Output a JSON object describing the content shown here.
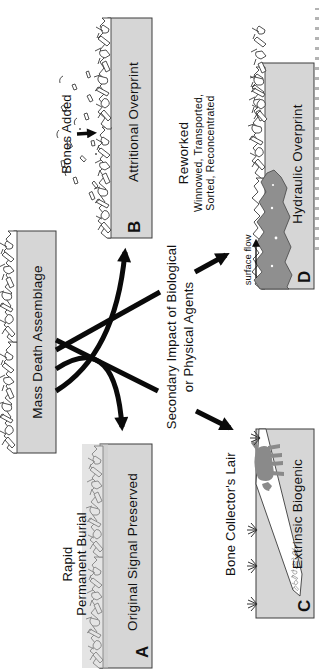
{
  "diagram": {
    "source_label": "Mass Death Assemblage",
    "center_label_line1": "Secondary Impact of Biological",
    "center_label_line2": "or Physical Agents",
    "panels": {
      "a": {
        "letter": "A",
        "title": "Original Signal Preserved",
        "caption_line1": "Rapid",
        "caption_line2": "Permanent Burial"
      },
      "b": {
        "letter": "B",
        "title": "Attritional Overprint",
        "caption": "Bones Added"
      },
      "c": {
        "letter": "C",
        "title": "Extrinsic Biogenic",
        "caption": "Bone Collector's Lair"
      },
      "d": {
        "letter": "D",
        "title": "Hydraulic Overprint",
        "caption_line1": "Reworked",
        "caption_line2": "Winnowed, Transported,",
        "caption_line3": "Sorted, Reconcentrated",
        "flow_label": "surface flow"
      }
    },
    "colors": {
      "strip": "#d6d6d6",
      "water": "#8f8f8f",
      "animal": "#8a8a8a",
      "arrow": "#0a0a0a",
      "outline": "#3c3c3c"
    }
  }
}
